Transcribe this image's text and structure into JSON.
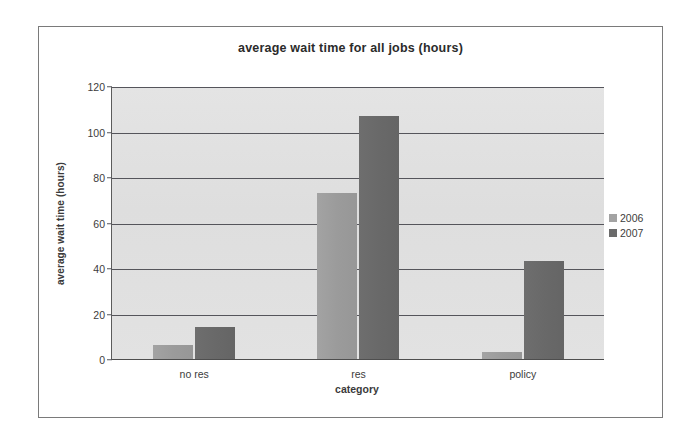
{
  "chart_data": {
    "type": "bar",
    "title": "average wait time for all jobs (hours)",
    "xlabel": "category",
    "ylabel": "average wait time (hours)",
    "categories": [
      "no res",
      "res",
      "policy"
    ],
    "series": [
      {
        "name": "2006",
        "color": "#a3a3a3",
        "values": [
          6,
          73,
          3
        ]
      },
      {
        "name": "2007",
        "color": "#6b6b6b",
        "values": [
          14,
          107,
          43
        ]
      }
    ],
    "ylim": [
      0,
      120
    ],
    "ytick_labels": [
      "0",
      "20",
      "40",
      "60",
      "80",
      "100",
      "120"
    ],
    "ytick_values": [
      0,
      20,
      40,
      60,
      80,
      100,
      120
    ],
    "grid": true,
    "legend_position": "right"
  }
}
